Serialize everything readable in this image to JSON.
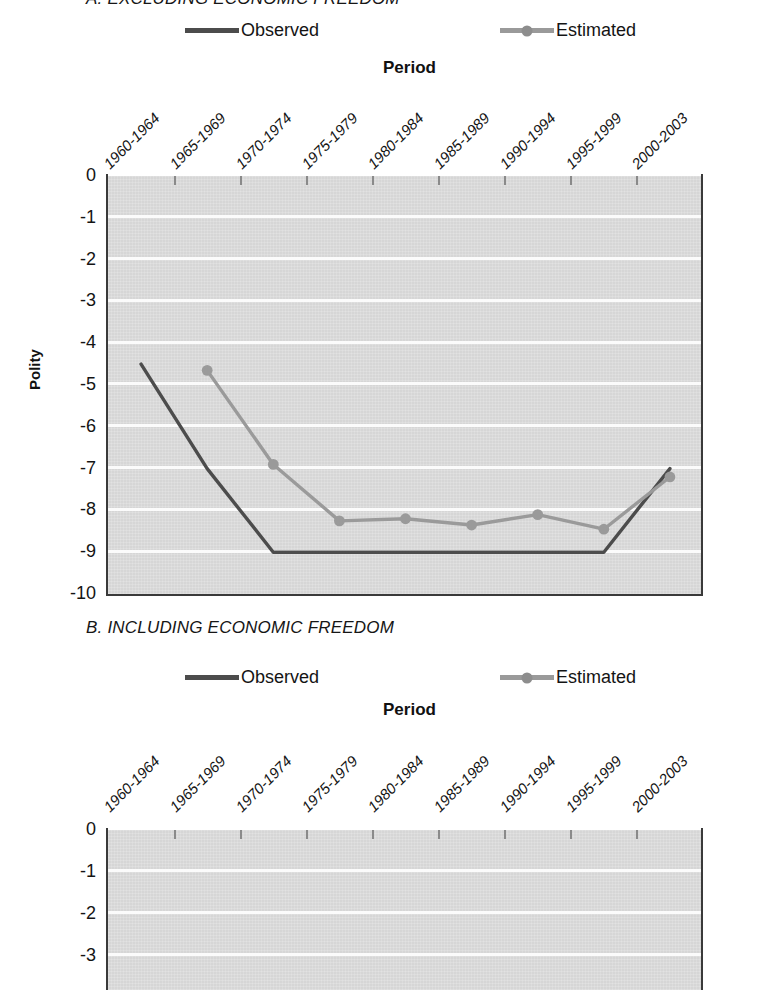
{
  "figure": {
    "panels": [
      {
        "id": "A",
        "title": "A. EXCLUDING ECONOMIC FREEDOM",
        "title_clipped": true,
        "legend": [
          {
            "label": "Observed",
            "color": "#4c4c4c",
            "marker": false
          },
          {
            "label": "Estimated",
            "color": "#9a9a9a",
            "marker": true
          }
        ],
        "xlabel": "Period",
        "ylabel": "Polity",
        "yticks": [
          "0",
          "-1",
          "-2",
          "-3",
          "-4",
          "-5",
          "-6",
          "-7",
          "-8",
          "-9",
          "-10"
        ],
        "xticks": [
          "1960-1964",
          "1965-1969",
          "1970-1974",
          "1975-1979",
          "1980-1984",
          "1985-1989",
          "1990-1994",
          "1995-1999",
          "2000-2003"
        ]
      },
      {
        "id": "B",
        "title": "B. INCLUDING ECONOMIC FREEDOM",
        "title_clipped": false,
        "legend": [
          {
            "label": "Observed",
            "color": "#4c4c4c",
            "marker": false
          },
          {
            "label": "Estimated",
            "color": "#9a9a9a",
            "marker": true
          }
        ],
        "xlabel": "Period",
        "ylabel": "",
        "yticks": [
          "0",
          "-1",
          "-2",
          "-3"
        ],
        "xticks": [
          "1960-1964",
          "1965-1969",
          "1970-1974",
          "1975-1979",
          "1980-1984",
          "1985-1989",
          "1990-1994",
          "1995-1999",
          "2000-2003"
        ]
      }
    ]
  },
  "chart_data": [
    {
      "type": "line",
      "title": "A. EXCLUDING ECONOMIC FREEDOM",
      "xlabel": "Period",
      "ylabel": "Polity",
      "ylim": [
        -10,
        0
      ],
      "yticks": [
        0,
        -1,
        -2,
        -3,
        -4,
        -5,
        -6,
        -7,
        -8,
        -9,
        -10
      ],
      "grid": true,
      "legend_position": "top",
      "categories": [
        "1960-1964",
        "1965-1969",
        "1970-1974",
        "1975-1979",
        "1980-1984",
        "1985-1989",
        "1990-1994",
        "1995-1999",
        "2000-2003"
      ],
      "series": [
        {
          "name": "Observed",
          "color": "#4c4c4c",
          "marker": false,
          "values": [
            -4.5,
            -7.0,
            -9.0,
            -9.0,
            -9.0,
            -9.0,
            -9.0,
            -9.0,
            -7.0
          ]
        },
        {
          "name": "Estimated",
          "color": "#9a9a9a",
          "marker": true,
          "values": [
            null,
            -4.65,
            -6.9,
            -8.25,
            -8.2,
            -8.35,
            -8.1,
            -8.45,
            -7.2
          ]
        }
      ]
    },
    {
      "type": "line",
      "title": "B. INCLUDING ECONOMIC FREEDOM",
      "xlabel": "Period",
      "ylabel": "",
      "ylim": [
        -3,
        0
      ],
      "yticks": [
        0,
        -1,
        -2,
        -3
      ],
      "grid": true,
      "legend_position": "top",
      "note": "plot area cropped by bottom edge of screenshot; no data lines visible",
      "categories": [
        "1960-1964",
        "1965-1969",
        "1970-1974",
        "1975-1979",
        "1980-1984",
        "1985-1989",
        "1990-1994",
        "1995-1999",
        "2000-2003"
      ],
      "series": [
        {
          "name": "Observed",
          "color": "#4c4c4c",
          "marker": false,
          "values": []
        },
        {
          "name": "Estimated",
          "color": "#9a9a9a",
          "marker": true,
          "values": []
        }
      ]
    }
  ]
}
